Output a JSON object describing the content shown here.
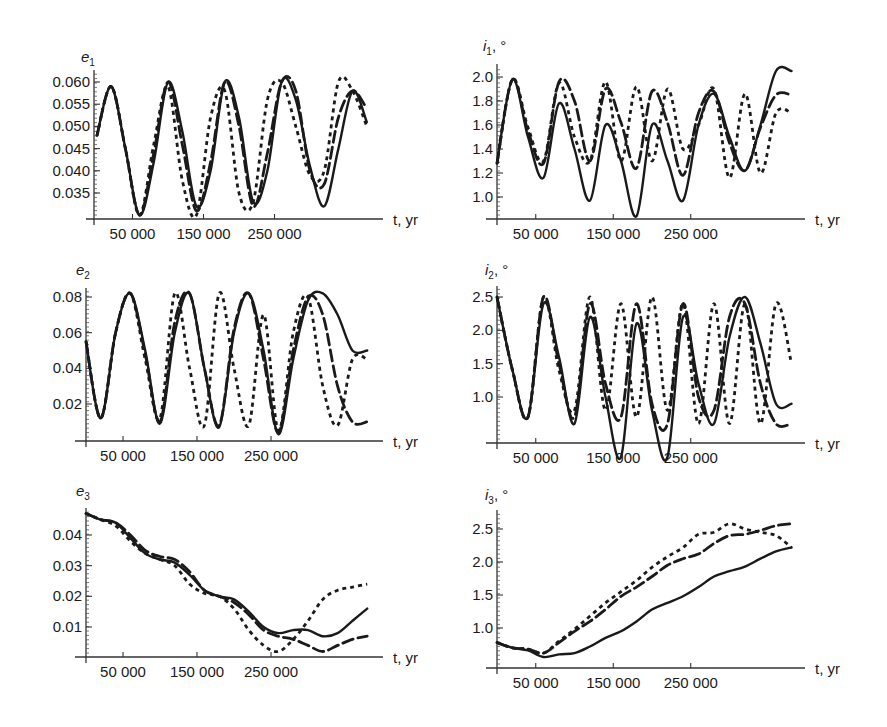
{
  "figure": {
    "x_axis_label": "t, yr",
    "x_tick_labels": [
      "50 000",
      "150 000",
      "250 000"
    ],
    "line_styles": [
      "solid",
      "dashed",
      "dotted"
    ]
  },
  "chart_data": [
    {
      "type": "line",
      "panel": "top-left",
      "title": "",
      "ylabel": "e1",
      "xlabel": "t, yr",
      "x_ticks": [
        50000,
        150000,
        250000
      ],
      "y_ticks": [
        0.035,
        0.04,
        0.045,
        0.05,
        0.055,
        0.06
      ],
      "y_tick_labels": [
        "0.035",
        "0.040",
        "0.045",
        "0.050",
        "0.055",
        "0.060"
      ],
      "xlim": [
        0,
        380000
      ],
      "ylim": [
        0.0295,
        0.062
      ],
      "x": [
        0,
        20000,
        40000,
        60000,
        80000,
        100000,
        120000,
        140000,
        160000,
        180000,
        200000,
        220000,
        240000,
        260000,
        280000,
        300000,
        320000,
        340000,
        360000,
        380000
      ],
      "series": [
        {
          "name": "solid",
          "style": "solid",
          "values": [
            0.048,
            0.059,
            0.045,
            0.03,
            0.042,
            0.06,
            0.049,
            0.032,
            0.04,
            0.06,
            0.052,
            0.033,
            0.04,
            0.06,
            0.056,
            0.041,
            0.032,
            0.045,
            0.058,
            0.051
          ]
        },
        {
          "name": "dashed",
          "style": "dashed",
          "values": [
            0.048,
            0.059,
            0.045,
            0.03,
            0.044,
            0.06,
            0.046,
            0.031,
            0.042,
            0.06,
            0.05,
            0.032,
            0.044,
            0.06,
            0.058,
            0.04,
            0.037,
            0.052,
            0.058,
            0.054
          ]
        },
        {
          "name": "dotted",
          "style": "dotted",
          "values": [
            0.048,
            0.059,
            0.045,
            0.03,
            0.046,
            0.059,
            0.038,
            0.03,
            0.052,
            0.058,
            0.035,
            0.033,
            0.056,
            0.06,
            0.05,
            0.039,
            0.04,
            0.06,
            0.058,
            0.05
          ]
        }
      ]
    },
    {
      "type": "line",
      "panel": "top-right",
      "ylabel": "i1, °",
      "xlabel": "t, yr",
      "x_ticks": [
        50000,
        150000,
        250000
      ],
      "y_ticks": [
        1.0,
        1.2,
        1.4,
        1.6,
        1.8,
        2.0
      ],
      "y_tick_labels": [
        "1.0",
        "1.2",
        "1.4",
        "1.6",
        "1.8",
        "2.0"
      ],
      "xlim": [
        0,
        380000
      ],
      "ylim": [
        0.83,
        2.1
      ],
      "x": [
        0,
        20000,
        40000,
        60000,
        80000,
        100000,
        120000,
        140000,
        160000,
        180000,
        200000,
        220000,
        240000,
        260000,
        280000,
        300000,
        320000,
        340000,
        360000,
        380000
      ],
      "series": [
        {
          "name": "solid",
          "style": "solid",
          "values": [
            1.28,
            1.98,
            1.5,
            1.16,
            1.78,
            1.4,
            0.97,
            1.6,
            1.3,
            0.84,
            1.6,
            1.3,
            0.97,
            1.6,
            1.86,
            1.5,
            1.22,
            1.6,
            2.05,
            2.05
          ]
        },
        {
          "name": "dashed",
          "style": "dashed",
          "values": [
            1.28,
            1.98,
            1.55,
            1.28,
            1.96,
            1.8,
            1.3,
            1.9,
            1.62,
            1.24,
            1.88,
            1.62,
            1.18,
            1.7,
            1.88,
            1.45,
            1.22,
            1.58,
            1.85,
            1.85
          ]
        },
        {
          "name": "dotted",
          "style": "dotted",
          "values": [
            1.28,
            1.98,
            1.58,
            1.3,
            1.95,
            1.5,
            1.3,
            1.96,
            1.3,
            1.92,
            1.3,
            1.9,
            1.4,
            1.6,
            1.9,
            1.16,
            1.86,
            1.2,
            1.7,
            1.7
          ]
        }
      ]
    },
    {
      "type": "line",
      "panel": "middle-left",
      "ylabel": "e2",
      "xlabel": "t, yr",
      "x_ticks": [
        50000,
        150000,
        250000
      ],
      "y_ticks": [
        0.02,
        0.04,
        0.06,
        0.08
      ],
      "y_tick_labels": [
        "0.02",
        "0.04",
        "0.06",
        "0.08"
      ],
      "xlim": [
        0,
        380000
      ],
      "ylim": [
        0.0,
        0.085
      ],
      "x": [
        0,
        20000,
        40000,
        60000,
        80000,
        100000,
        120000,
        140000,
        160000,
        180000,
        200000,
        220000,
        240000,
        260000,
        280000,
        300000,
        320000,
        340000,
        360000,
        380000
      ],
      "series": [
        {
          "name": "solid",
          "style": "solid",
          "values": [
            0.055,
            0.012,
            0.06,
            0.082,
            0.05,
            0.009,
            0.06,
            0.082,
            0.04,
            0.007,
            0.06,
            0.082,
            0.05,
            0.003,
            0.045,
            0.078,
            0.082,
            0.07,
            0.05,
            0.05
          ]
        },
        {
          "name": "dashed",
          "style": "dashed",
          "values": [
            0.055,
            0.012,
            0.06,
            0.082,
            0.048,
            0.01,
            0.066,
            0.082,
            0.04,
            0.008,
            0.062,
            0.082,
            0.045,
            0.004,
            0.05,
            0.08,
            0.07,
            0.03,
            0.01,
            0.01
          ]
        },
        {
          "name": "dotted",
          "style": "dotted",
          "values": [
            0.055,
            0.012,
            0.06,
            0.082,
            0.045,
            0.012,
            0.082,
            0.04,
            0.008,
            0.082,
            0.04,
            0.008,
            0.07,
            0.005,
            0.06,
            0.08,
            0.03,
            0.008,
            0.045,
            0.045
          ]
        }
      ]
    },
    {
      "type": "line",
      "panel": "middle-right",
      "ylabel": "i2, °",
      "xlabel": "t, yr",
      "x_ticks": [
        50000,
        150000,
        250000
      ],
      "y_ticks": [
        1.0,
        1.5,
        2.0,
        2.5
      ],
      "y_tick_labels": [
        "1.0",
        "1.5",
        "2.0",
        "2.5"
      ],
      "xlim": [
        0,
        380000
      ],
      "ylim": [
        0.1,
        2.6
      ],
      "x": [
        0,
        20000,
        40000,
        60000,
        80000,
        100000,
        120000,
        140000,
        160000,
        180000,
        200000,
        220000,
        240000,
        260000,
        280000,
        300000,
        320000,
        340000,
        360000,
        380000
      ],
      "series": [
        {
          "name": "solid",
          "style": "solid",
          "values": [
            2.5,
            1.4,
            0.7,
            2.4,
            1.6,
            0.6,
            2.2,
            1.0,
            0.1,
            2.1,
            0.8,
            0.1,
            2.2,
            1.2,
            0.6,
            1.9,
            2.5,
            1.8,
            0.9,
            0.9
          ]
        },
        {
          "name": "dashed",
          "style": "dashed",
          "values": [
            2.5,
            1.4,
            0.7,
            2.5,
            1.5,
            0.7,
            2.4,
            1.2,
            0.7,
            2.4,
            0.9,
            0.6,
            2.4,
            1.0,
            0.8,
            2.2,
            2.4,
            1.2,
            0.6,
            0.6
          ]
        },
        {
          "name": "dotted",
          "style": "dotted",
          "values": [
            2.5,
            1.4,
            0.7,
            2.5,
            1.4,
            0.8,
            2.5,
            0.8,
            2.4,
            0.7,
            2.5,
            0.8,
            2.4,
            0.6,
            2.4,
            0.6,
            2.4,
            0.6,
            2.4,
            1.5
          ]
        }
      ]
    },
    {
      "type": "line",
      "panel": "bottom-left",
      "ylabel": "e3",
      "xlabel": "t, yr",
      "x_ticks": [
        50000,
        150000,
        250000
      ],
      "y_ticks": [
        0.01,
        0.02,
        0.03,
        0.04
      ],
      "y_tick_labels": [
        "0.01",
        "0.02",
        "0.03",
        "0.04"
      ],
      "xlim": [
        0,
        380000
      ],
      "ylim": [
        0.0,
        0.048
      ],
      "x": [
        0,
        20000,
        40000,
        60000,
        80000,
        100000,
        120000,
        140000,
        160000,
        180000,
        200000,
        220000,
        240000,
        260000,
        280000,
        300000,
        320000,
        340000,
        360000,
        380000
      ],
      "series": [
        {
          "name": "solid",
          "style": "solid",
          "values": [
            0.047,
            0.045,
            0.044,
            0.039,
            0.034,
            0.032,
            0.031,
            0.027,
            0.022,
            0.02,
            0.019,
            0.015,
            0.01,
            0.008,
            0.009,
            0.009,
            0.007,
            0.008,
            0.012,
            0.016
          ]
        },
        {
          "name": "dashed",
          "style": "dashed",
          "values": [
            0.047,
            0.045,
            0.044,
            0.04,
            0.035,
            0.033,
            0.032,
            0.028,
            0.022,
            0.02,
            0.018,
            0.014,
            0.009,
            0.007,
            0.006,
            0.004,
            0.002,
            0.004,
            0.006,
            0.007
          ]
        },
        {
          "name": "dotted",
          "style": "dotted",
          "values": [
            0.047,
            0.045,
            0.043,
            0.038,
            0.034,
            0.032,
            0.03,
            0.024,
            0.021,
            0.02,
            0.016,
            0.009,
            0.004,
            0.002,
            0.006,
            0.012,
            0.019,
            0.022,
            0.023,
            0.024
          ]
        }
      ]
    },
    {
      "type": "line",
      "panel": "bottom-right",
      "ylabel": "i3, °",
      "xlabel": "t, yr",
      "x_ticks": [
        50000,
        150000,
        250000
      ],
      "y_ticks": [
        1.0,
        1.5,
        2.0,
        2.5
      ],
      "y_tick_labels": [
        "1.0",
        "1.5",
        "2.0",
        "2.5"
      ],
      "xlim": [
        0,
        380000
      ],
      "ylim": [
        0.55,
        2.65
      ],
      "x": [
        0,
        20000,
        40000,
        60000,
        80000,
        100000,
        120000,
        140000,
        160000,
        180000,
        200000,
        220000,
        240000,
        260000,
        280000,
        300000,
        320000,
        340000,
        360000,
        380000
      ],
      "series": [
        {
          "name": "solid",
          "style": "solid",
          "values": [
            0.78,
            0.7,
            0.66,
            0.56,
            0.6,
            0.62,
            0.72,
            0.85,
            0.95,
            1.1,
            1.28,
            1.38,
            1.48,
            1.62,
            1.78,
            1.86,
            1.93,
            2.05,
            2.16,
            2.22
          ]
        },
        {
          "name": "dashed",
          "style": "dashed",
          "values": [
            0.78,
            0.7,
            0.68,
            0.62,
            0.78,
            0.95,
            1.1,
            1.28,
            1.48,
            1.62,
            1.78,
            1.95,
            2.05,
            2.12,
            2.28,
            2.4,
            2.42,
            2.48,
            2.55,
            2.58
          ]
        },
        {
          "name": "dotted",
          "style": "dotted",
          "values": [
            0.78,
            0.7,
            0.68,
            0.62,
            0.8,
            0.98,
            1.18,
            1.38,
            1.55,
            1.72,
            1.92,
            2.08,
            2.22,
            2.42,
            2.45,
            2.58,
            2.5,
            2.45,
            2.4,
            2.22
          ]
        }
      ]
    }
  ]
}
